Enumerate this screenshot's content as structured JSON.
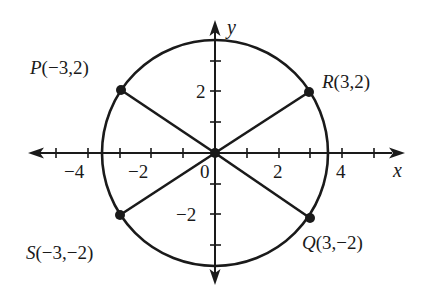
{
  "figure": {
    "axes": {
      "x_label": "x",
      "y_label": "y",
      "origin_label": "0",
      "x_tick_labels": [
        {
          "value": -4,
          "text": "−4"
        },
        {
          "value": -2,
          "text": "−2"
        },
        {
          "value": 2,
          "text": "2"
        },
        {
          "value": 4,
          "text": "4"
        }
      ],
      "y_tick_labels": [
        {
          "value": 2,
          "text": "2"
        },
        {
          "value": -2,
          "text": "−2"
        }
      ],
      "x_ticks": [
        -4,
        -3,
        -2,
        -1,
        1,
        2,
        3,
        4,
        5
      ],
      "y_ticks": [
        -3,
        -2,
        -1,
        1,
        2,
        3
      ]
    },
    "circle": {
      "center": [
        0,
        0
      ],
      "radius_expr": "√13"
    },
    "points": [
      {
        "name": "P",
        "coords": "(−3,2)",
        "x": -3,
        "y": 2
      },
      {
        "name": "R",
        "coords": "(3,2)",
        "x": 3,
        "y": 2
      },
      {
        "name": "S",
        "coords": "(−3,−2)",
        "x": -3,
        "y": -2
      },
      {
        "name": "Q",
        "coords": "(3,−2)",
        "x": 3,
        "y": -2
      }
    ],
    "colors": {
      "ink": "#1a1a1a",
      "background": "#ffffff"
    }
  }
}
